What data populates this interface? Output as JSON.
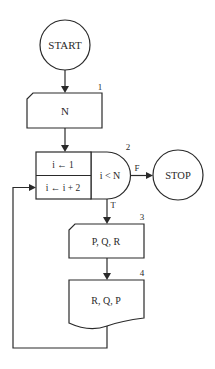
{
  "diagram": {
    "type": "flowchart",
    "nodes": {
      "start": {
        "label": "START",
        "shape": "circle"
      },
      "input_n": {
        "label": "N",
        "number": "1",
        "shape": "card"
      },
      "loop": {
        "number": "2",
        "init": "i ← 1",
        "increment": "i ← i + 2",
        "condition": "i < N",
        "false_label": "F",
        "true_label": "T"
      },
      "stop": {
        "label": "STOP",
        "shape": "circle"
      },
      "input_pqr": {
        "label": "P, Q, R",
        "number": "3",
        "shape": "card"
      },
      "output_rqp": {
        "label": "R, Q, P",
        "number": "4",
        "shape": "document"
      }
    },
    "edges": [
      {
        "from": "START",
        "to": "1"
      },
      {
        "from": "1",
        "to": "2"
      },
      {
        "from": "2",
        "to": "STOP",
        "label": "F"
      },
      {
        "from": "2",
        "to": "3",
        "label": "T"
      },
      {
        "from": "3",
        "to": "4"
      },
      {
        "from": "4",
        "to": "2 (increment)"
      }
    ]
  }
}
